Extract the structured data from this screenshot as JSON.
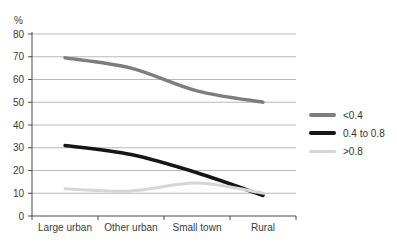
{
  "chart_data": {
    "type": "line",
    "title": "",
    "ylabel": "%",
    "xlabel": "",
    "categories": [
      "Large urban",
      "Other urban",
      "Small town",
      "Rural"
    ],
    "series": [
      {
        "name": "<0.4",
        "color": "#7d7d7d",
        "width": 3.5,
        "values": [
          69.5,
          65,
          55,
          50
        ]
      },
      {
        "name": "0.4 to 0.8",
        "color": "#161616",
        "width": 3.5,
        "values": [
          31,
          27,
          19,
          9
        ]
      },
      {
        "name": ">0.8",
        "color": "#d6d6d6",
        "width": 3,
        "values": [
          12,
          11,
          14.5,
          10
        ]
      }
    ],
    "ylim": [
      0,
      80
    ],
    "ytick_step": 10,
    "grid": true,
    "grid_color": "#b9b9b9",
    "axis_color": "#4a4a4a",
    "text_color": "#3a3a3a",
    "legend_position": "right"
  }
}
